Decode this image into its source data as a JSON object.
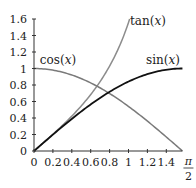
{
  "chart_data": {
    "type": "line",
    "title": "",
    "xlabel": "",
    "ylabel": "",
    "xlim": [
      0,
      1.5708
    ],
    "ylim": [
      0,
      1.6
    ],
    "grid": false,
    "x_ticks": [
      "0",
      "0.2",
      "0.4",
      "0.6",
      "0.8",
      "1",
      "1.2",
      "1.4"
    ],
    "x_tick_values": [
      0,
      0.2,
      0.4,
      0.6,
      0.8,
      1,
      1.2,
      1.4
    ],
    "x_end_label": {
      "numerator": "π",
      "denominator": "2",
      "value": 1.5708
    },
    "y_ticks": [
      "0",
      "0.2",
      "0.4",
      "0.6",
      "0.8",
      "1",
      "1.2",
      "1.4",
      "1.6"
    ],
    "y_tick_values": [
      0,
      0.2,
      0.4,
      0.6,
      0.8,
      1,
      1.2,
      1.4,
      1.6
    ],
    "series": [
      {
        "name": "tan",
        "label": "tan(x)",
        "func": "tan",
        "color": "#8c8c8c",
        "domain": [
          0,
          1.012
        ],
        "x": [
          0,
          0.2,
          0.4,
          0.6,
          0.8,
          1.0,
          1.012
        ],
        "values": [
          0,
          0.203,
          0.423,
          0.684,
          1.03,
          1.557,
          1.6
        ]
      },
      {
        "name": "cos",
        "label": "cos(x)",
        "func": "cos",
        "color": "#7a7a7a",
        "domain": [
          0,
          1.5708
        ],
        "x": [
          0,
          0.2,
          0.4,
          0.6,
          0.8,
          1.0,
          1.2,
          1.4,
          1.5708
        ],
        "values": [
          1,
          0.98,
          0.921,
          0.825,
          0.697,
          0.54,
          0.362,
          0.17,
          0
        ]
      },
      {
        "name": "sin",
        "label": "sin(x)",
        "func": "sin",
        "color": "#111111",
        "domain": [
          0,
          1.5708
        ],
        "x": [
          0,
          0.2,
          0.4,
          0.6,
          0.8,
          1.0,
          1.2,
          1.4,
          1.5708
        ],
        "values": [
          0,
          0.199,
          0.389,
          0.565,
          0.717,
          0.841,
          0.932,
          0.985,
          1
        ]
      }
    ]
  }
}
